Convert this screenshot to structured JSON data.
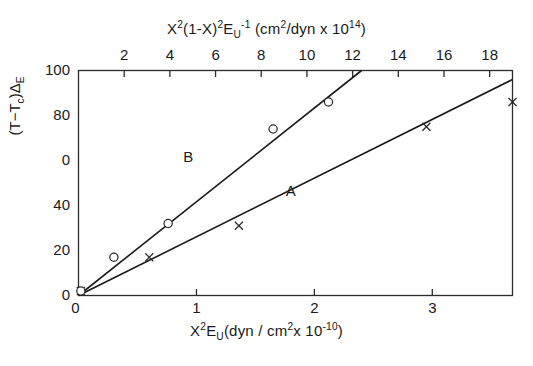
{
  "chart_data": {
    "type": "scatter",
    "title": "",
    "xlabel": "X²E_U (dyn / cm² x 10⁻¹⁰)",
    "xlabel_top": "X²(1-X)²E_U⁻¹ (cm²/dyn x 10¹⁴)",
    "ylabel": "(T−T_c)Δ_E",
    "xlim": [
      0,
      3.68
    ],
    "ylim": [
      0,
      100
    ],
    "xlim_top": [
      0,
      19.0
    ],
    "grid": false,
    "legend_position": "inline-annotation",
    "xticks": [
      0,
      1,
      2,
      3
    ],
    "xticklabels": [
      "0",
      "1",
      "2",
      "3"
    ],
    "xticks_top": [
      2,
      4,
      6,
      8,
      10,
      12,
      14,
      16,
      18
    ],
    "xticklabels_top": [
      "2",
      "4",
      "6",
      "8",
      "10",
      "12",
      "14",
      "16",
      "18"
    ],
    "yticks": [
      0,
      20,
      40,
      60,
      80,
      100
    ],
    "yticklabels": [
      "0",
      "20",
      "40",
      "0",
      "80",
      "100"
    ],
    "series": [
      {
        "name": "A",
        "marker": "x",
        "axis": "bottom",
        "x": [
          0.02,
          0.6,
          1.36,
          2.95,
          3.68
        ],
        "y": [
          2,
          17,
          31,
          75,
          86
        ],
        "fit_line": {
          "x": [
            0.0,
            3.68
          ],
          "y": [
            0,
            96
          ]
        }
      },
      {
        "name": "B",
        "marker": "o",
        "axis": "bottom",
        "x": [
          0.02,
          0.3,
          0.76,
          1.65,
          2.12
        ],
        "y": [
          2,
          17,
          32,
          74,
          86
        ],
        "fit_line": {
          "x": [
            0.0,
            2.4
          ],
          "y": [
            0,
            100
          ]
        }
      }
    ],
    "annotations": [
      {
        "text": "B",
        "x": 0.93,
        "y": 61
      },
      {
        "text": "A",
        "x": 1.8,
        "y": 46
      }
    ]
  },
  "axes": {
    "top": {
      "title_parts": {
        "p1": "X",
        "p1sup": "2",
        "p2": "(1-X)",
        "p2sup": "2",
        "p3": "E",
        "p3sub": "U",
        "p3sup": "-1",
        "p4": " (cm",
        "p4sup": "2",
        "p5": "/dyn x 10",
        "p5sup": "14",
        "p6": ")"
      },
      "ticklabels": [
        "2",
        "4",
        "6",
        "8",
        "10",
        "12",
        "14",
        "16",
        "18"
      ]
    },
    "bottom": {
      "title_parts": {
        "p1": "X",
        "p1sup": "2",
        "p2": "E",
        "p2sub": "U",
        "p3": "(dyn / cm",
        "p3sup": "2",
        "p4": "x 10",
        "p4sup": "-10",
        "p5": ")"
      },
      "ticklabels": [
        "0",
        "1",
        "2",
        "3"
      ]
    },
    "left": {
      "title_parts": {
        "p1": "(T−T",
        "p1sub": "c",
        "p2": ")Δ",
        "p2sub": "E"
      },
      "ticklabels": [
        "100",
        "80",
        "0",
        "40",
        "20",
        "0"
      ]
    }
  },
  "style": {
    "axis_color": "#2b2b2b",
    "line_color": "#1a1a1a",
    "marker_color": "#2b2b2b",
    "background": "#ffffff"
  }
}
